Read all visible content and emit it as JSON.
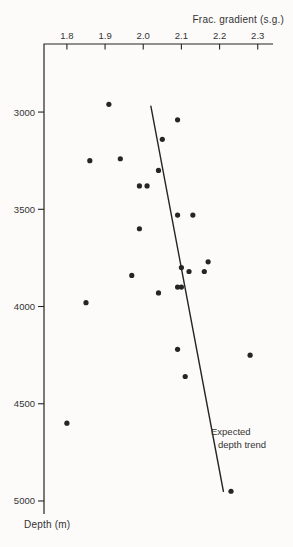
{
  "figure": {
    "x_axis_title": "Frac. gradient (s.g.)",
    "y_axis_title": "Depth (m)",
    "annotation": {
      "line1": "Expected",
      "line2": "depth trend"
    },
    "colors": {
      "ink": "#252525",
      "text": "#333333",
      "paper": "#fcfbfa"
    }
  },
  "chart_data": {
    "type": "scatter",
    "title": "",
    "xlabel": "Frac. gradient (s.g.)",
    "ylabel": "Depth (m)",
    "x_axis_position": "top",
    "y_axis_inverted": true,
    "xlim": [
      1.74,
      2.34
    ],
    "ylim": [
      2650,
      5067
    ],
    "x_ticks": [
      1.8,
      1.9,
      2.0,
      2.1,
      2.2,
      2.3
    ],
    "y_ticks": [
      3000,
      3500,
      4000,
      4500,
      5000
    ],
    "grid": false,
    "legend": false,
    "series": [
      {
        "name": "frac-gradient-measurements",
        "marker": "dot",
        "points": [
          {
            "frac_gradient": 1.91,
            "depth_m": 2960
          },
          {
            "frac_gradient": 2.09,
            "depth_m": 3040
          },
          {
            "frac_gradient": 2.05,
            "depth_m": 3140
          },
          {
            "frac_gradient": 1.94,
            "depth_m": 3240
          },
          {
            "frac_gradient": 1.86,
            "depth_m": 3250
          },
          {
            "frac_gradient": 2.04,
            "depth_m": 3300
          },
          {
            "frac_gradient": 1.99,
            "depth_m": 3380
          },
          {
            "frac_gradient": 2.01,
            "depth_m": 3380
          },
          {
            "frac_gradient": 2.09,
            "depth_m": 3530
          },
          {
            "frac_gradient": 2.13,
            "depth_m": 3530
          },
          {
            "frac_gradient": 1.99,
            "depth_m": 3600
          },
          {
            "frac_gradient": 2.17,
            "depth_m": 3770
          },
          {
            "frac_gradient": 2.1,
            "depth_m": 3800
          },
          {
            "frac_gradient": 2.12,
            "depth_m": 3820
          },
          {
            "frac_gradient": 2.16,
            "depth_m": 3820
          },
          {
            "frac_gradient": 1.97,
            "depth_m": 3840
          },
          {
            "frac_gradient": 2.09,
            "depth_m": 3900
          },
          {
            "frac_gradient": 2.1,
            "depth_m": 3900
          },
          {
            "frac_gradient": 2.04,
            "depth_m": 3930
          },
          {
            "frac_gradient": 1.85,
            "depth_m": 3980
          },
          {
            "frac_gradient": 2.09,
            "depth_m": 4220
          },
          {
            "frac_gradient": 2.28,
            "depth_m": 4250
          },
          {
            "frac_gradient": 2.11,
            "depth_m": 4360
          },
          {
            "frac_gradient": 1.8,
            "depth_m": 4600
          },
          {
            "frac_gradient": 2.23,
            "depth_m": 4950
          }
        ]
      }
    ],
    "trend_line": {
      "label": "Expected depth trend",
      "start": {
        "frac_gradient": 2.02,
        "depth_m": 2970
      },
      "end": {
        "frac_gradient": 2.21,
        "depth_m": 4950
      }
    }
  }
}
